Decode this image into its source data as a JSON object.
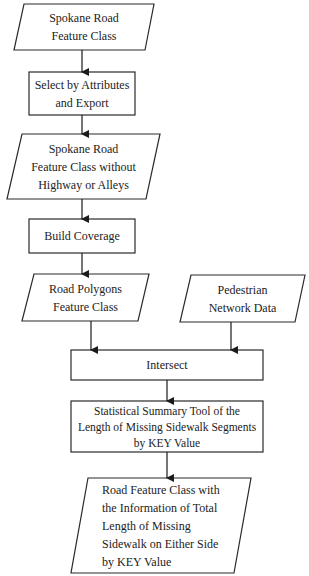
{
  "diagram": {
    "type": "flowchart",
    "nodes": [
      {
        "id": "n1",
        "shape": "parallelogram",
        "lines": [
          "Spokane Road",
          "Feature Class"
        ]
      },
      {
        "id": "n2",
        "shape": "rectangle",
        "lines": [
          "Select by Attributes",
          "and Export"
        ]
      },
      {
        "id": "n3",
        "shape": "parallelogram",
        "lines": [
          "Spokane Road",
          "Feature Class without",
          "Highway or Alleys"
        ]
      },
      {
        "id": "n4",
        "shape": "rectangle",
        "lines": [
          "Build Coverage"
        ]
      },
      {
        "id": "n5",
        "shape": "parallelogram",
        "lines": [
          "Road Polygons",
          "Feature Class"
        ]
      },
      {
        "id": "n6",
        "shape": "parallelogram",
        "lines": [
          "Pedestrian",
          "Network Data"
        ]
      },
      {
        "id": "n7",
        "shape": "rectangle",
        "lines": [
          "Intersect"
        ]
      },
      {
        "id": "n8",
        "shape": "rectangle",
        "lines": [
          "Statistical Summary Tool of the",
          "Length of Missing Sidewalk Segments",
          "by KEY Value"
        ]
      },
      {
        "id": "n9",
        "shape": "parallelogram",
        "lines": [
          "Road Feature Class with",
          "the Information of Total",
          "Length of Missing",
          "Sidewalk on Either Side",
          "by KEY Value"
        ]
      }
    ],
    "edges": [
      {
        "from": "n1",
        "to": "n2"
      },
      {
        "from": "n2",
        "to": "n3"
      },
      {
        "from": "n3",
        "to": "n4"
      },
      {
        "from": "n4",
        "to": "n5"
      },
      {
        "from": "n5",
        "to": "n7"
      },
      {
        "from": "n6",
        "to": "n7"
      },
      {
        "from": "n7",
        "to": "n8"
      },
      {
        "from": "n8",
        "to": "n9"
      }
    ],
    "colors": {
      "stroke": "#2a2a2a",
      "fill": "#ffffff",
      "text": "#222222"
    }
  }
}
